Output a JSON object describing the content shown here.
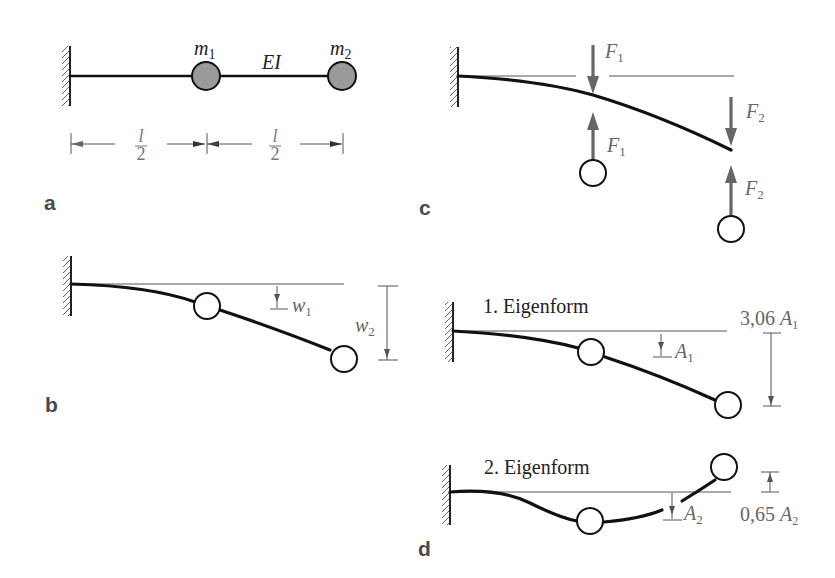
{
  "panels": {
    "a": {
      "label": "a",
      "mass1": {
        "name": "m",
        "sub": "1"
      },
      "mass2": {
        "name": "m",
        "sub": "2"
      },
      "stiffness": "EI",
      "dim_left": {
        "num": "l",
        "den": "2"
      },
      "dim_right": {
        "num": "l",
        "den": "2"
      }
    },
    "b": {
      "label": "b",
      "w1": {
        "name": "w",
        "sub": "1"
      },
      "w2": {
        "name": "w",
        "sub": "2"
      }
    },
    "c": {
      "label": "c",
      "f1_top": {
        "name": "F",
        "sub": "1"
      },
      "f1_bottom": {
        "name": "F",
        "sub": "1"
      },
      "f2_top": {
        "name": "F",
        "sub": "2"
      },
      "f2_bottom": {
        "name": "F",
        "sub": "2"
      }
    },
    "d": {
      "label": "d",
      "mode1": {
        "title": "1. Eigenform",
        "amp_small": {
          "name": "A",
          "sub": "1"
        },
        "amp_big": {
          "prefix": "3,06",
          "name": "A",
          "sub": "1"
        }
      },
      "mode2": {
        "title": "2. Eigenform",
        "amp_small": {
          "name": "A",
          "sub": "2"
        },
        "amp_big": {
          "prefix": "0,65",
          "name": "A",
          "sub": "2"
        }
      }
    }
  },
  "colors": {
    "beam": "#111111",
    "mass_fill": "#9a9a9a",
    "force": "#666666",
    "dimension": "#555555",
    "panel_label": "#4a4a4a"
  }
}
